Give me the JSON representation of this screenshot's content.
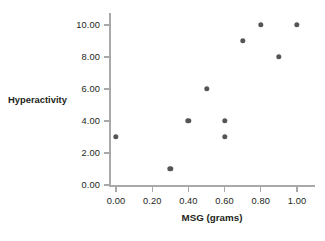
{
  "chart_data": {
    "type": "scatter",
    "title": "",
    "subtitle": "",
    "xlabel": "MSG (grams)",
    "ylabel": "Hyperactivity",
    "xlim": [
      0.0,
      1.0
    ],
    "ylim": [
      0.0,
      10.0
    ],
    "grid": false,
    "legend": null,
    "legend_position": "none",
    "xticks": [
      0.0,
      0.2,
      0.4,
      0.6,
      0.8,
      1.0
    ],
    "xtick_labels": [
      "0.00",
      "0.20",
      "0.40",
      "0.60",
      "0.80",
      "1.00"
    ],
    "yticks": [
      0.0,
      2.0,
      4.0,
      6.0,
      8.0,
      10.0
    ],
    "ytick_labels": [
      "0.00",
      "2.00",
      "4.00",
      "6.00",
      "8.00",
      "10.00"
    ],
    "marker_color": "#555558",
    "axis_color": "#a9a9a9",
    "text_color": "#231f20",
    "background_color": "#ffffff",
    "series": [
      {
        "name": "observations",
        "x": [
          0.0,
          0.3,
          0.4,
          0.5,
          0.6,
          0.6,
          0.7,
          0.8,
          0.9,
          1.0
        ],
        "y": [
          3.0,
          1.0,
          4.0,
          6.0,
          3.0,
          4.0,
          9.0,
          10.0,
          8.0,
          10.0
        ],
        "points": [
          {
            "x": 0.0,
            "y": 3.0
          },
          {
            "x": 0.3,
            "y": 1.0
          },
          {
            "x": 0.4,
            "y": 4.0
          },
          {
            "x": 0.5,
            "y": 6.0
          },
          {
            "x": 0.6,
            "y": 3.0
          },
          {
            "x": 0.6,
            "y": 4.0
          },
          {
            "x": 0.7,
            "y": 9.0
          },
          {
            "x": 0.8,
            "y": 10.0
          },
          {
            "x": 0.9,
            "y": 8.0
          },
          {
            "x": 1.0,
            "y": 10.0
          }
        ]
      }
    ]
  }
}
